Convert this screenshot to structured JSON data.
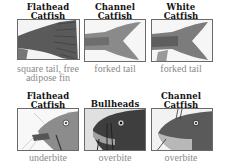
{
  "rows": [
    {
      "name": "tails",
      "items": [
        {
          "title": [
            "Flathead",
            "Catfish"
          ],
          "caption": [
            "square tail, free",
            "adipose fin"
          ],
          "image": "flathead-tail"
        },
        {
          "title": [
            "Channel",
            "Catfish"
          ],
          "caption": [
            "forked tail"
          ],
          "image": "channel-tail"
        },
        {
          "title": [
            "White",
            "Catfish"
          ],
          "caption": [
            "forked tail"
          ],
          "image": "white-tail"
        }
      ]
    },
    {
      "name": "heads",
      "items": [
        {
          "title": [
            "Flathead",
            "Catfish"
          ],
          "caption": [
            "underbite"
          ],
          "image": "flathead-head"
        },
        {
          "title": [
            "Bullheads"
          ],
          "caption": [
            "overbite"
          ],
          "image": "bullhead-head"
        },
        {
          "title": [
            "Channel",
            "Catfish"
          ],
          "caption": [
            "overbite"
          ],
          "image": "channel-head"
        }
      ]
    }
  ],
  "colors": {
    "frame_border": "#6a6a6a",
    "caption": "#8a8a8a",
    "title": "#111111"
  }
}
